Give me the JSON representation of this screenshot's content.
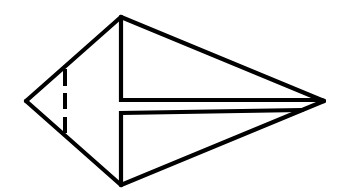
{
  "diagram": {
    "title": "",
    "stroke_color": "#000000",
    "background_color": "#ffffff",
    "shape": {
      "outline_points": [
        [
          121,
          17
        ],
        [
          324,
          101
        ],
        [
          121,
          185
        ],
        [
          26,
          101
        ]
      ],
      "top_vertex": [
        121,
        17
      ],
      "right_tip": [
        324,
        101
      ],
      "bottom_vertex": [
        121,
        185
      ],
      "left_vertex": [
        26,
        101
      ]
    },
    "inner_lines": [
      {
        "name": "upper-flap-edge",
        "from": [
          121,
          17
        ],
        "via": [
          121,
          100
        ],
        "to": [
          322,
          100
        ]
      },
      {
        "name": "lower-flap-edge",
        "from": [
          121,
          185
        ],
        "via": [
          121,
          113
        ],
        "to": [
          302,
          110
        ]
      }
    ],
    "dashed_line": {
      "name": "valley-fold-line",
      "x": 65,
      "y_start": 69,
      "y_end": 133,
      "dash_pattern": "16 8"
    }
  }
}
